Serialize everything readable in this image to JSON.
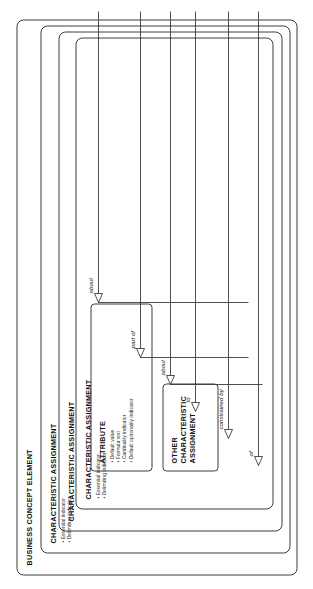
{
  "diagram": {
    "type": "nested-entity-diagram",
    "orientation": "rotated-90-ccw",
    "outer": {
      "title": "BUSINESS CONCEPT ELEMENT"
    },
    "levels": [
      {
        "id": "ca-1",
        "title": "CHARACTERISTIC ASSIGNMENT",
        "bullets": [
          "Essential indicator",
          "Delimiting indicator"
        ]
      },
      {
        "id": "ca-2",
        "title": "CHARACTERISTIC ASSIGNMENT",
        "bullets": []
      },
      {
        "id": "ca-3",
        "title": "CHARACTERISTIC ASSIGNMENT",
        "bullets": [
          "Essential indicator",
          "Delimiting indicator"
        ]
      }
    ],
    "leaves": [
      {
        "id": "attribute",
        "title": "ATTRIBUTE",
        "bullets": [
          "Default value",
          "Formula text",
          "Cardinality indicator",
          "Default optionality indicator"
        ]
      },
      {
        "id": "other-ca",
        "title": "OTHER CHARACTERISTIC ASSIGNMENT",
        "title_lines": [
          "OTHER",
          "CHARACTERISTIC",
          "ASSIGNMENT"
        ],
        "bullets": []
      }
    ],
    "relationships": [
      {
        "id": "rel-about-1",
        "label": "about"
      },
      {
        "id": "rel-part-of",
        "label": "part of"
      },
      {
        "id": "rel-about-2",
        "label": "about"
      },
      {
        "id": "rel-to",
        "label": "to"
      },
      {
        "id": "rel-constrained-by",
        "label": "constrained by"
      },
      {
        "id": "rel-of",
        "label": "of"
      }
    ],
    "colors": {
      "stroke": "#3c3c3c",
      "text": "#111111",
      "background": "#ffffff"
    }
  }
}
